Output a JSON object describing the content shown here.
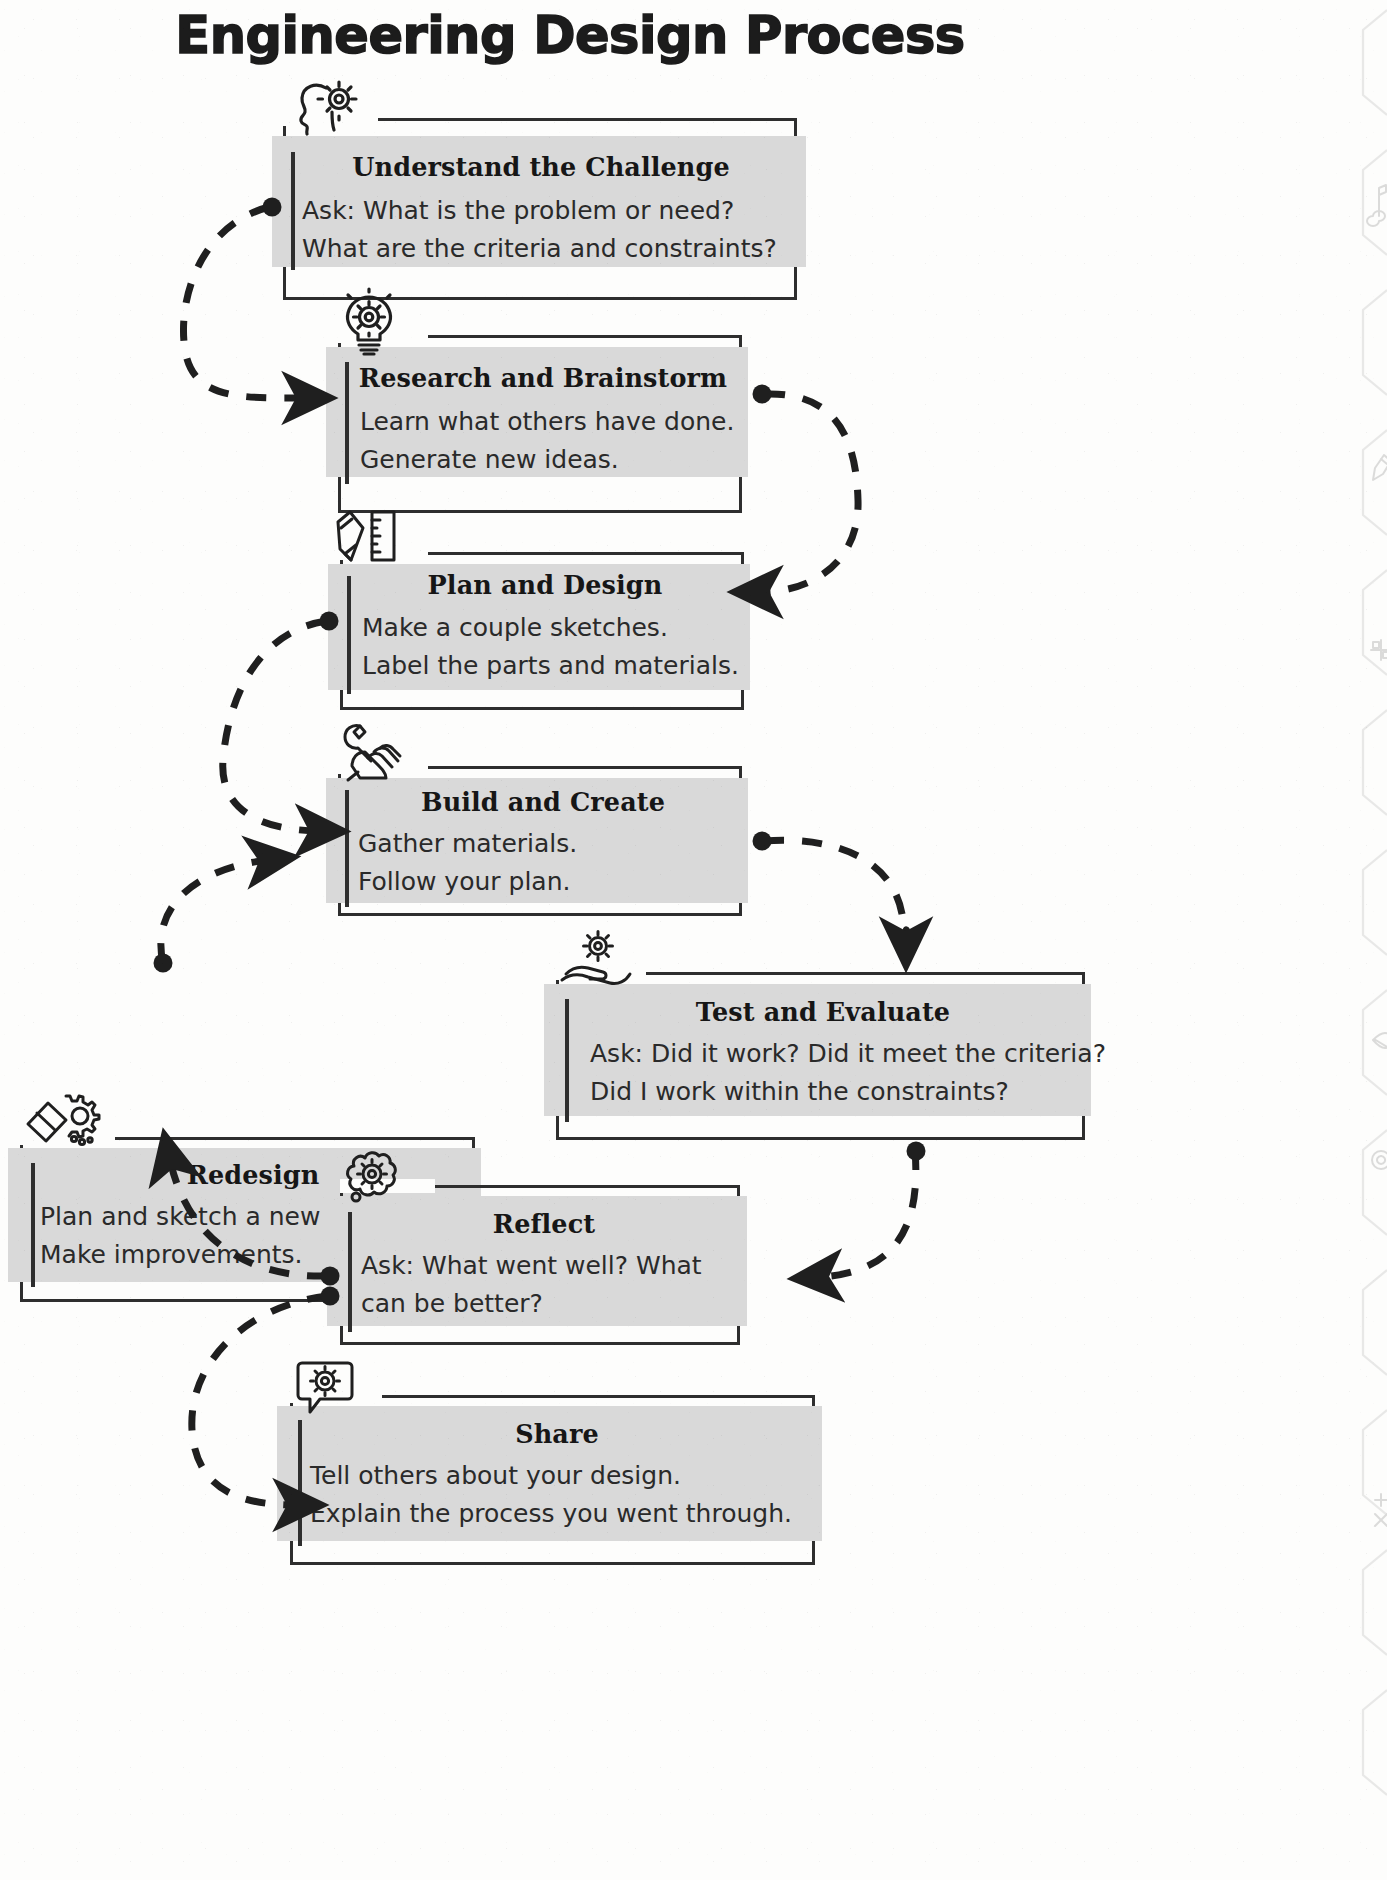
{
  "page": {
    "title": "Engineering Design Process",
    "accent_fill": "#d9d9d9",
    "line_color": "#2e2e2e",
    "background": "#fdfdfc"
  },
  "steps": [
    {
      "id": "understand",
      "title": "Understand the Challenge",
      "body": "Ask: What is the problem or need?\nWhat are the criteria and constraints?",
      "icon": "head-gear-icon"
    },
    {
      "id": "research",
      "title": "Research and Brainstorm",
      "body": "Learn what others have done.\nGenerate new ideas.",
      "icon": "lightbulb-gear-icon"
    },
    {
      "id": "plan",
      "title": "Plan and Design",
      "body": "Make a couple sketches.\nLabel the parts and materials.",
      "icon": "pencil-ruler-icon"
    },
    {
      "id": "build",
      "title": "Build and Create",
      "body": "Gather materials.\nFollow your plan.",
      "icon": "hand-wrench-icon"
    },
    {
      "id": "redesign",
      "title": "Redesign",
      "body": "Plan and sketch a new design.\nMake improvements.",
      "icon": "eraser-gear-icon"
    },
    {
      "id": "test",
      "title": "Test and Evaluate",
      "body": "Ask: Did it work?  Did it meet the criteria?\nDid I work within the constraints?",
      "icon": "hand-holding-gear-icon"
    },
    {
      "id": "reflect",
      "title": "Reflect",
      "body": "Ask: What went well?  What\ncan be better?",
      "icon": "thought-bubble-gear-icon"
    },
    {
      "id": "share",
      "title": "Share",
      "body": "Tell others about your design.\nExplain the process you went through.",
      "icon": "speech-bubble-gear-icon"
    }
  ],
  "flow": [
    {
      "from": "understand",
      "to": "research"
    },
    {
      "from": "research",
      "to": "plan"
    },
    {
      "from": "plan",
      "to": "build"
    },
    {
      "from": "build",
      "to": "test"
    },
    {
      "from": "test",
      "to": "reflect"
    },
    {
      "from": "reflect",
      "to": "redesign"
    },
    {
      "from": "reflect",
      "to": "share"
    },
    {
      "from": "redesign",
      "to": "build"
    }
  ]
}
